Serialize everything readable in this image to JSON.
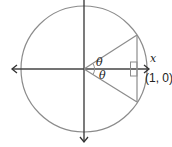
{
  "diagram": {
    "type": "unit-circle",
    "labels": {
      "theta_upper": "θ",
      "theta_lower": "θ",
      "x_axis": "x",
      "point": "(1, 0)"
    },
    "colors": {
      "circle": "#8c8c8c",
      "axes": "#333333",
      "lines": "#8c8c8c",
      "text": "#222222"
    }
  }
}
